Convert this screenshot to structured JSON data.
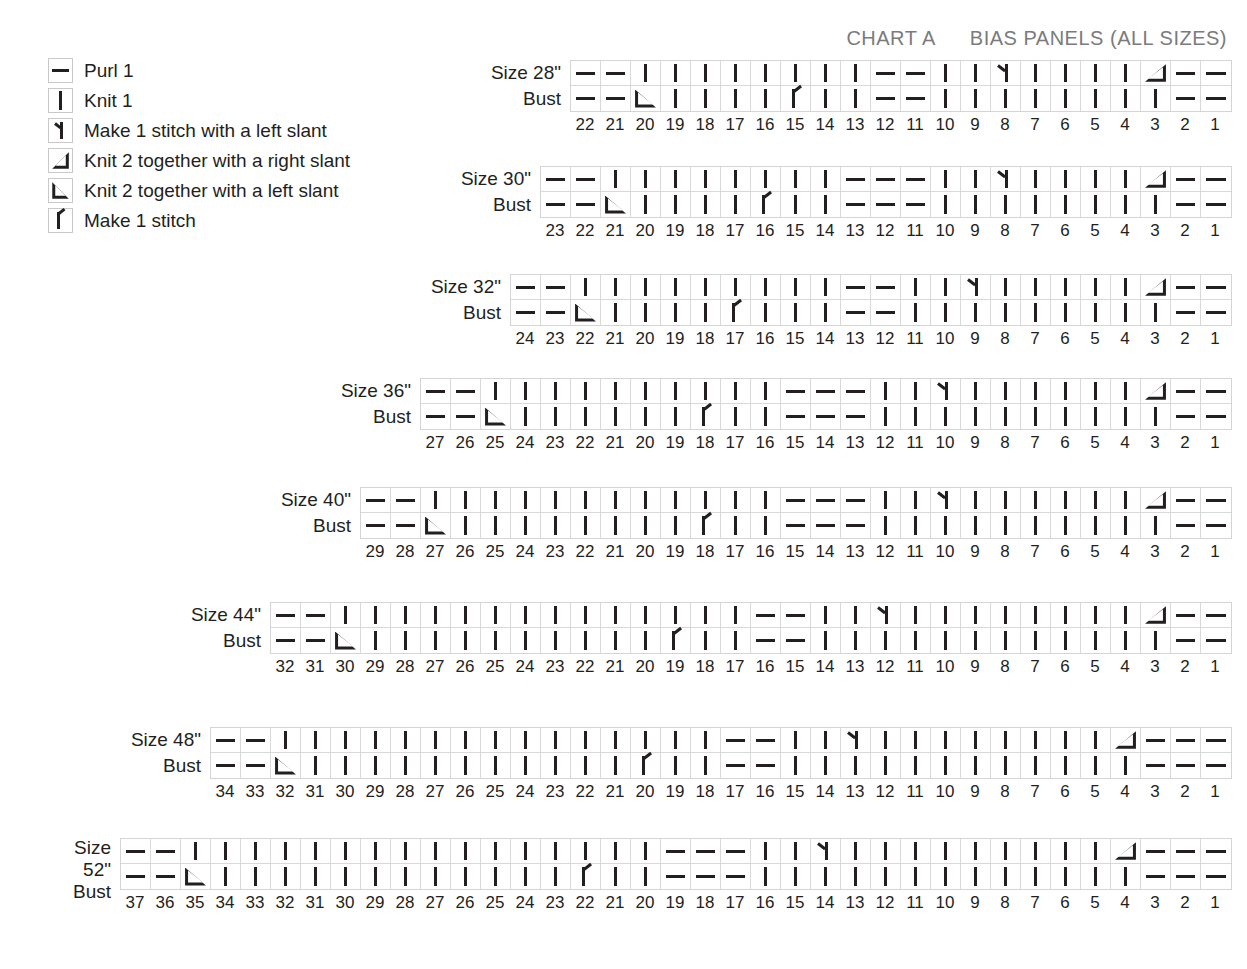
{
  "header": {
    "chart_name": "CHART A",
    "chart_title": "BIAS PANELS (ALL SIZES)"
  },
  "legend": {
    "items": [
      {
        "symbol": "purl",
        "label": "Purl 1"
      },
      {
        "symbol": "knit",
        "label": "Knit 1"
      },
      {
        "symbol": "m1l",
        "label": "Make 1 stitch with a left slant"
      },
      {
        "symbol": "k2r",
        "label": "Knit 2 together with a right slant"
      },
      {
        "symbol": "k2l",
        "label": "Knit 2 together with a left slant"
      },
      {
        "symbol": "m1",
        "label": "Make 1 stitch"
      }
    ]
  },
  "symbol_names": {
    "purl": "purl-1-icon",
    "knit": "knit-1-icon",
    "m1l": "make-1-left-slant-icon",
    "m1": "make-1-icon",
    "k2r": "knit-2-together-right-slant-icon",
    "k2l": "knit-2-together-left-slant-icon"
  },
  "chart_data": {
    "type": "table",
    "title": "CHART A  BIAS PANELS (ALL SIZES)",
    "legend_keys": [
      "purl",
      "knit",
      "m1l",
      "k2r",
      "k2l",
      "m1"
    ],
    "charts": [
      {
        "label_lines": [
          "Size 28\"",
          "Bust"
        ],
        "size": "28\"",
        "stitches": 22,
        "numbers": [
          22,
          21,
          20,
          19,
          18,
          17,
          16,
          15,
          14,
          13,
          12,
          11,
          10,
          9,
          8,
          7,
          6,
          5,
          4,
          3,
          2,
          1
        ],
        "rows": [
          {
            "name": "row-1",
            "cells": [
              "purl",
              "purl",
              "knit",
              "knit",
              "knit",
              "knit",
              "knit",
              "knit",
              "knit",
              "knit",
              "purl",
              "purl",
              "knit",
              "knit",
              "m1l",
              "knit",
              "knit",
              "knit",
              "knit",
              "k2r",
              "purl",
              "purl"
            ]
          },
          {
            "name": "row-2",
            "cells": [
              "purl",
              "purl",
              "k2l",
              "knit",
              "knit",
              "knit",
              "knit",
              "m1",
              "knit",
              "knit",
              "purl",
              "purl",
              "knit",
              "knit",
              "knit",
              "knit",
              "knit",
              "knit",
              "knit",
              "knit",
              "purl",
              "purl"
            ]
          }
        ]
      },
      {
        "label_lines": [
          "Size 30\"",
          "Bust"
        ],
        "size": "30\"",
        "stitches": 23,
        "numbers": [
          23,
          22,
          21,
          20,
          19,
          18,
          17,
          16,
          15,
          14,
          13,
          12,
          11,
          10,
          9,
          8,
          7,
          6,
          5,
          4,
          3,
          2,
          1
        ],
        "rows": [
          {
            "name": "row-1",
            "cells": [
              "purl",
              "purl",
              "knit",
              "knit",
              "knit",
              "knit",
              "knit",
              "knit",
              "knit",
              "knit",
              "purl",
              "purl",
              "purl",
              "knit",
              "knit",
              "m1l",
              "knit",
              "knit",
              "knit",
              "knit",
              "k2r",
              "purl",
              "purl"
            ]
          },
          {
            "name": "row-2",
            "cells": [
              "purl",
              "purl",
              "k2l",
              "knit",
              "knit",
              "knit",
              "knit",
              "m1",
              "knit",
              "knit",
              "purl",
              "purl",
              "purl",
              "knit",
              "knit",
              "knit",
              "knit",
              "knit",
              "knit",
              "knit",
              "knit",
              "purl",
              "purl"
            ]
          }
        ]
      },
      {
        "label_lines": [
          "Size 32\"",
          "Bust"
        ],
        "size": "32\"",
        "stitches": 24,
        "numbers": [
          24,
          23,
          22,
          21,
          20,
          19,
          18,
          17,
          16,
          15,
          14,
          13,
          12,
          11,
          10,
          9,
          8,
          7,
          6,
          5,
          4,
          3,
          2,
          1
        ],
        "rows": [
          {
            "name": "row-1",
            "cells": [
              "purl",
              "purl",
              "knit",
              "knit",
              "knit",
              "knit",
              "knit",
              "knit",
              "knit",
              "knit",
              "knit",
              "purl",
              "purl",
              "knit",
              "knit",
              "m1l",
              "knit",
              "knit",
              "knit",
              "knit",
              "knit",
              "k2r",
              "purl",
              "purl"
            ]
          },
          {
            "name": "row-2",
            "cells": [
              "purl",
              "purl",
              "k2l",
              "knit",
              "knit",
              "knit",
              "knit",
              "m1",
              "knit",
              "knit",
              "knit",
              "purl",
              "purl",
              "knit",
              "knit",
              "knit",
              "knit",
              "knit",
              "knit",
              "knit",
              "knit",
              "knit",
              "purl",
              "purl"
            ]
          }
        ]
      },
      {
        "label_lines": [
          "Size 36\"",
          "Bust"
        ],
        "size": "36\"",
        "stitches": 27,
        "numbers": [
          27,
          26,
          25,
          24,
          23,
          22,
          21,
          20,
          19,
          18,
          17,
          16,
          15,
          14,
          13,
          12,
          11,
          10,
          9,
          8,
          7,
          6,
          5,
          4,
          3,
          2,
          1
        ],
        "rows": [
          {
            "name": "row-1",
            "cells": [
              "purl",
              "purl",
              "knit",
              "knit",
              "knit",
              "knit",
              "knit",
              "knit",
              "knit",
              "knit",
              "knit",
              "knit",
              "purl",
              "purl",
              "purl",
              "knit",
              "knit",
              "m1l",
              "knit",
              "knit",
              "knit",
              "knit",
              "knit",
              "knit",
              "k2r",
              "purl",
              "purl"
            ]
          },
          {
            "name": "row-2",
            "cells": [
              "purl",
              "purl",
              "k2l",
              "knit",
              "knit",
              "knit",
              "knit",
              "knit",
              "knit",
              "m1",
              "knit",
              "knit",
              "purl",
              "purl",
              "purl",
              "knit",
              "knit",
              "knit",
              "knit",
              "knit",
              "knit",
              "knit",
              "knit",
              "knit",
              "knit",
              "purl",
              "purl"
            ]
          }
        ]
      },
      {
        "label_lines": [
          "Size 40\"",
          "Bust"
        ],
        "size": "40\"",
        "stitches": 29,
        "numbers": [
          29,
          28,
          27,
          26,
          25,
          24,
          23,
          22,
          21,
          20,
          19,
          18,
          17,
          16,
          15,
          14,
          13,
          12,
          11,
          10,
          9,
          8,
          7,
          6,
          5,
          4,
          3,
          2,
          1
        ],
        "rows": [
          {
            "name": "row-1",
            "cells": [
              "purl",
              "purl",
              "knit",
              "knit",
              "knit",
              "knit",
              "knit",
              "knit",
              "knit",
              "knit",
              "knit",
              "knit",
              "knit",
              "knit",
              "purl",
              "purl",
              "purl",
              "knit",
              "knit",
              "m1l",
              "knit",
              "knit",
              "knit",
              "knit",
              "knit",
              "knit",
              "k2r",
              "purl",
              "purl"
            ]
          },
          {
            "name": "row-2",
            "cells": [
              "purl",
              "purl",
              "k2l",
              "knit",
              "knit",
              "knit",
              "knit",
              "knit",
              "knit",
              "knit",
              "knit",
              "m1",
              "knit",
              "knit",
              "purl",
              "purl",
              "purl",
              "knit",
              "knit",
              "knit",
              "knit",
              "knit",
              "knit",
              "knit",
              "knit",
              "knit",
              "knit",
              "purl",
              "purl"
            ]
          }
        ]
      },
      {
        "label_lines": [
          "Size 44\"",
          "Bust"
        ],
        "size": "44\"",
        "stitches": 32,
        "numbers": [
          32,
          31,
          30,
          29,
          28,
          27,
          26,
          25,
          24,
          23,
          22,
          21,
          20,
          19,
          18,
          17,
          16,
          15,
          14,
          13,
          12,
          11,
          10,
          9,
          8,
          7,
          6,
          5,
          4,
          3,
          2,
          1
        ],
        "rows": [
          {
            "name": "row-1",
            "cells": [
              "purl",
              "purl",
              "knit",
              "knit",
              "knit",
              "knit",
              "knit",
              "knit",
              "knit",
              "knit",
              "knit",
              "knit",
              "knit",
              "knit",
              "knit",
              "knit",
              "purl",
              "purl",
              "knit",
              "knit",
              "m1l",
              "knit",
              "knit",
              "knit",
              "knit",
              "knit",
              "knit",
              "knit",
              "knit",
              "k2r",
              "purl",
              "purl"
            ]
          },
          {
            "name": "row-2",
            "cells": [
              "purl",
              "purl",
              "k2l",
              "knit",
              "knit",
              "knit",
              "knit",
              "knit",
              "knit",
              "knit",
              "knit",
              "knit",
              "knit",
              "m1",
              "knit",
              "knit",
              "purl",
              "purl",
              "knit",
              "knit",
              "knit",
              "knit",
              "knit",
              "knit",
              "knit",
              "knit",
              "knit",
              "knit",
              "knit",
              "knit",
              "purl",
              "purl"
            ]
          }
        ]
      },
      {
        "label_lines": [
          "Size 48\"",
          "Bust"
        ],
        "size": "48\"",
        "stitches": 34,
        "numbers": [
          34,
          33,
          32,
          31,
          30,
          29,
          28,
          27,
          26,
          25,
          24,
          23,
          22,
          21,
          20,
          19,
          18,
          17,
          16,
          15,
          14,
          13,
          12,
          11,
          10,
          9,
          8,
          7,
          6,
          5,
          4,
          3,
          2,
          1
        ],
        "rows": [
          {
            "name": "row-1",
            "cells": [
              "purl",
              "purl",
              "knit",
              "knit",
              "knit",
              "knit",
              "knit",
              "knit",
              "knit",
              "knit",
              "knit",
              "knit",
              "knit",
              "knit",
              "knit",
              "knit",
              "knit",
              "purl",
              "purl",
              "knit",
              "knit",
              "m1l",
              "knit",
              "knit",
              "knit",
              "knit",
              "knit",
              "knit",
              "knit",
              "knit",
              "k2r",
              "purl",
              "purl",
              "purl"
            ]
          },
          {
            "name": "row-2",
            "cells": [
              "purl",
              "purl",
              "k2l",
              "knit",
              "knit",
              "knit",
              "knit",
              "knit",
              "knit",
              "knit",
              "knit",
              "knit",
              "knit",
              "knit",
              "m1",
              "knit",
              "knit",
              "purl",
              "purl",
              "knit",
              "knit",
              "knit",
              "knit",
              "knit",
              "knit",
              "knit",
              "knit",
              "knit",
              "knit",
              "knit",
              "knit",
              "purl",
              "purl",
              "purl"
            ]
          }
        ]
      },
      {
        "label_lines": [
          "Size",
          "52\"",
          "Bust"
        ],
        "size": "52\"",
        "stitches": 37,
        "numbers": [
          37,
          36,
          35,
          34,
          33,
          32,
          31,
          30,
          29,
          28,
          27,
          26,
          25,
          24,
          23,
          22,
          21,
          20,
          19,
          18,
          17,
          16,
          15,
          14,
          13,
          12,
          11,
          10,
          9,
          8,
          7,
          6,
          5,
          4,
          3,
          2,
          1
        ],
        "rows": [
          {
            "name": "row-1",
            "cells": [
              "purl",
              "purl",
              "knit",
              "knit",
              "knit",
              "knit",
              "knit",
              "knit",
              "knit",
              "knit",
              "knit",
              "knit",
              "knit",
              "knit",
              "knit",
              "knit",
              "knit",
              "knit",
              "purl",
              "purl",
              "purl",
              "knit",
              "knit",
              "m1l",
              "knit",
              "knit",
              "knit",
              "knit",
              "knit",
              "knit",
              "knit",
              "knit",
              "knit",
              "k2r",
              "purl",
              "purl",
              "purl"
            ]
          },
          {
            "name": "row-2",
            "cells": [
              "purl",
              "purl",
              "k2l",
              "knit",
              "knit",
              "knit",
              "knit",
              "knit",
              "knit",
              "knit",
              "knit",
              "knit",
              "knit",
              "knit",
              "knit",
              "m1",
              "knit",
              "knit",
              "purl",
              "purl",
              "purl",
              "knit",
              "knit",
              "knit",
              "knit",
              "knit",
              "knit",
              "knit",
              "knit",
              "knit",
              "knit",
              "knit",
              "knit",
              "knit",
              "purl",
              "purl",
              "purl"
            ]
          }
        ]
      }
    ]
  },
  "layout": {
    "chart_tops": [
      60,
      166,
      274,
      378,
      487,
      602,
      727,
      838
    ],
    "chart_rights": [
      1232,
      1232,
      1232,
      1232,
      1232,
      1232,
      1232,
      1232
    ]
  }
}
